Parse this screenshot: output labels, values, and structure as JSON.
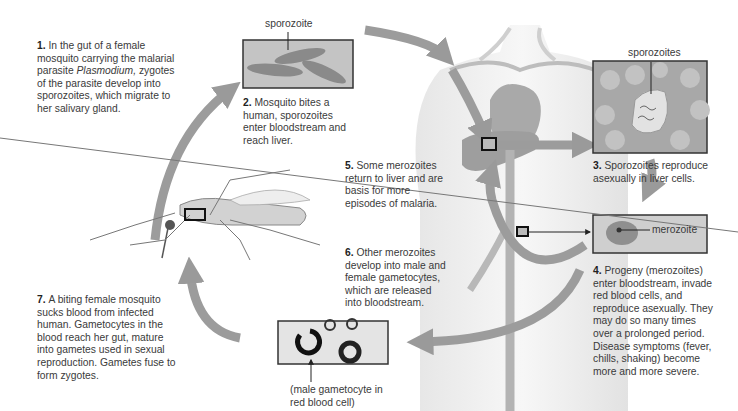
{
  "figure": {
    "steps": [
      {
        "num": "1.",
        "text_pre": "In the gut of a female mosquito carrying the malarial parasite ",
        "text_italic": "Plasmodium,",
        "text_post": " zygotes of the parasite develop into sporozoites, which migrate to her salivary gland."
      },
      {
        "num": "2.",
        "text": "Mosquito bites a human, sporozoites enter bloodstream and reach liver."
      },
      {
        "num": "3.",
        "text": "Sporozoites reproduce asexually in liver cells."
      },
      {
        "num": "4.",
        "text": "Progeny (merozoites) enter bloodstream, invade red blood cells, and reproduce asexually. They may do so many times over a prolonged period. Disease symptoms (fever, chills, shaking) become more and more severe."
      },
      {
        "num": "5.",
        "text": "Some merozoites return to liver and are basis for more episodes of malaria."
      },
      {
        "num": "6.",
        "text": "Other merozoites develop into male and female gametocytes, which are released into bloodstream."
      },
      {
        "num": "7.",
        "text": "A biting female mosquito sucks blood from infected human. Gametocytes in the blood reach her gut, mature into gametes used in sexual reproduction. Gametes fuse to form zygotes."
      }
    ],
    "labels": {
      "sporozoite": "sporozoite",
      "sporozoites": "sporozoites",
      "merozoite": "merozoite",
      "gametocyte_caption": "(male gametocyte in red blood cell)"
    },
    "colors": {
      "arrow": "#9a9a9a",
      "box_fill": "#c8c8c8",
      "cell_fill": "#8c8c8c",
      "border": "#333333",
      "text": "#3a3a3a"
    }
  }
}
